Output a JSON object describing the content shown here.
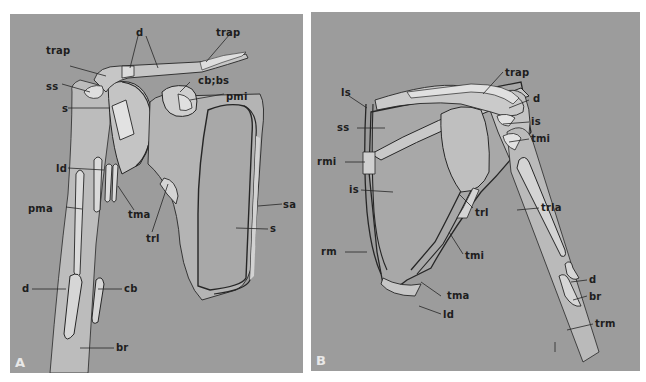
{
  "figure": {
    "panels": [
      {
        "id": "A",
        "letter": "A",
        "view": "anterior",
        "labels": {
          "trap": "trap",
          "d_top": "d",
          "trap_right": "trap",
          "ss": "ss",
          "s_left": "s",
          "cb_bs": "cb;bs",
          "pmi": "pmi",
          "ld": "ld",
          "tma": "tma",
          "pma": "pma",
          "trl": "trl",
          "sa": "sa",
          "s_right": "s",
          "d_bottom": "d",
          "cb": "cb",
          "br": "br"
        }
      },
      {
        "id": "B",
        "letter": "B",
        "view": "posterior",
        "labels": {
          "trap": "trap",
          "ls": "ls",
          "d": "d",
          "ss": "ss",
          "is_top": "is",
          "tmi_top": "tmi",
          "rmi": "rmi",
          "is_mid": "is",
          "trl": "trl",
          "trla": "trla",
          "rm": "rm",
          "tmi_mid": "tmi",
          "tma": "tma",
          "d_bottom": "d",
          "br": "br",
          "ld": "ld",
          "trm": "trm"
        }
      }
    ],
    "colors": {
      "background": "#9c9c9c",
      "bone": "#b9b9b9",
      "attachment": "#d2d2d2",
      "outline": "#262626",
      "label": "#1e1e1e"
    }
  }
}
